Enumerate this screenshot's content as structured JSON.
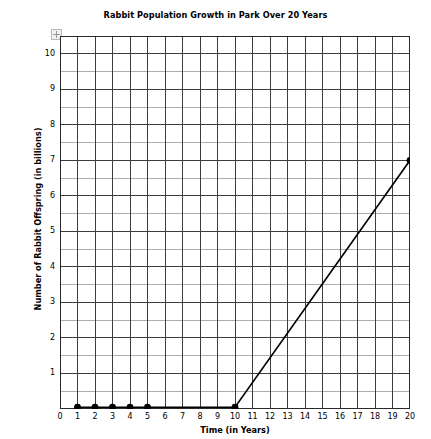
{
  "chart_data": {
    "type": "line",
    "title": "Rabbit Population Growth in Park Over 20 Years",
    "xlabel": "Time (in Years)",
    "ylabel": "Number of Rabbit Offspring (in billions)",
    "xlim": [
      0,
      20
    ],
    "ylim": [
      0,
      10.5
    ],
    "grid": true,
    "grid_major_x_step": 1,
    "grid_major_y_step": 1,
    "grid_minor_y_step": 0.5,
    "legend": "none",
    "xticks": [
      "0",
      "1",
      "2",
      "3",
      "4",
      "5",
      "6",
      "7",
      "8",
      "9",
      "10",
      "11",
      "12",
      "13",
      "14",
      "15",
      "16",
      "17",
      "18",
      "19",
      "20"
    ],
    "yticks": [
      "1",
      "2",
      "3",
      "4",
      "5",
      "6",
      "7",
      "8",
      "9",
      "10"
    ],
    "line_color": "#000000",
    "marker_color": "#000000",
    "grid_color": "#555555",
    "x": [
      1,
      2,
      3,
      4,
      5,
      10,
      20
    ],
    "values": [
      0.05,
      0.05,
      0.05,
      0.05,
      0.05,
      0.05,
      7
    ],
    "markers_at": [
      1,
      2,
      3,
      4,
      5,
      10,
      20
    ],
    "series": [
      {
        "name": "Rabbit offspring",
        "points": [
          {
            "x": 1,
            "y": 0.05
          },
          {
            "x": 2,
            "y": 0.05
          },
          {
            "x": 3,
            "y": 0.05
          },
          {
            "x": 4,
            "y": 0.05
          },
          {
            "x": 5,
            "y": 0.05
          },
          {
            "x": 10,
            "y": 0.05
          },
          {
            "x": 20,
            "y": 7
          }
        ]
      }
    ],
    "annotations": []
  },
  "axis_corner_icon": "resize-handle-icon"
}
